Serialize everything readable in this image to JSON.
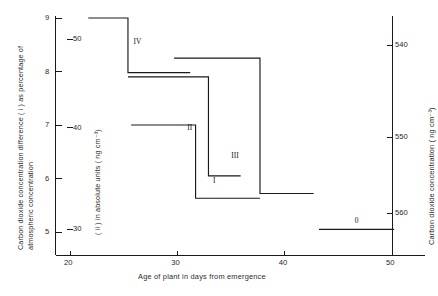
{
  "chart_data": {
    "type": "line",
    "title": "",
    "xlabel": "Age of plant in days from emergence",
    "ylabel_left_primary": "Carbon dioxide concentration difference ( i ) as percentage of atmospheric concentration",
    "ylabel_left_secondary": "( ii ) in absolute units ( ng cm⁻³)",
    "ylabel_right": "Carbon dioxide concentration ( ng cm⁻³)",
    "xlim": [
      18,
      55
    ],
    "xticks": [
      20,
      30,
      40,
      50
    ],
    "xticklabels": [
      "20",
      "30",
      "40",
      "50"
    ],
    "ylim_left_primary": [
      4.55,
      9.0
    ],
    "yticks_left_primary": [
      5,
      6,
      7,
      8,
      9
    ],
    "yticklabels_left_primary": [
      "5",
      "6",
      "7",
      "8",
      "9"
    ],
    "yticks_left_secondary": [
      30,
      40,
      50
    ],
    "yticklabels_left_secondary": [
      "30",
      "40",
      "50"
    ],
    "yticks_right": [
      540,
      550,
      560
    ],
    "yticklabels_right": [
      "540",
      "550",
      "560"
    ],
    "grid": false,
    "legend": "inline-labels",
    "series": [
      {
        "name": "IV",
        "label": "IV",
        "label_x": 26.2,
        "label_y": 8.55,
        "steps": [
          {
            "x_start": 21.7,
            "x_end": 25.4,
            "y": 9.0
          },
          {
            "x_start": 25.4,
            "x_end": 31.2,
            "y": 7.98
          }
        ]
      },
      {
        "name": "II",
        "label": "II",
        "label_x": 31.2,
        "label_y": 6.95,
        "steps": [
          {
            "x_start": 25.4,
            "x_end": 32.9,
            "y": 7.9
          },
          {
            "x_start": 32.9,
            "x_end": 35.9,
            "y": 6.05
          }
        ]
      },
      {
        "name": "III",
        "label": "III",
        "label_x": 35.3,
        "label_y": 6.42,
        "steps": [
          {
            "x_start": 29.7,
            "x_end": 37.7,
            "y": 8.25
          },
          {
            "x_start": 37.7,
            "x_end": 42.7,
            "y": 5.72
          }
        ]
      },
      {
        "name": "I",
        "label": "I",
        "label_x": 33.6,
        "label_y": 5.95,
        "steps": [
          {
            "x_start": 25.7,
            "x_end": 31.7,
            "y": 7.0
          },
          {
            "x_start": 31.7,
            "x_end": 37.7,
            "y": 5.63
          }
        ]
      },
      {
        "name": "0",
        "label": "0",
        "label_x": 46.8,
        "label_y": 5.2,
        "steps": [
          {
            "x_start": 43.2,
            "x_end": 50.2,
            "y": 5.05
          }
        ]
      }
    ]
  },
  "axes": {
    "x_axis_name": "x-axis",
    "y_axis_left_name": "y-axis-left",
    "y_axis_right": "y-axis-right"
  }
}
